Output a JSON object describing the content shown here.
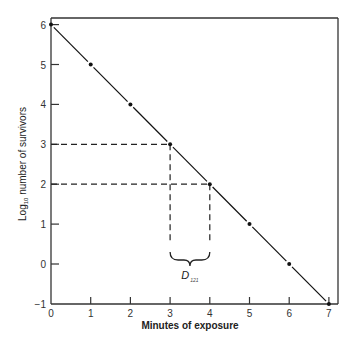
{
  "chart_data": {
    "type": "line",
    "title": "",
    "xlabel": "Minutes of exposure",
    "ylabel": "Log10 number of survivors",
    "ylabel_parts": {
      "main": "Log",
      "sub": "10",
      "rest": " number of survivors"
    },
    "x": [
      0,
      1,
      2,
      3,
      4,
      5,
      6,
      7
    ],
    "series": [
      {
        "name": "Survivor curve",
        "values": [
          6,
          5,
          4,
          3,
          2,
          1,
          0,
          -1
        ]
      }
    ],
    "xlim": [
      0,
      7
    ],
    "ylim": [
      -1,
      6
    ],
    "xticks": [
      "0",
      "1",
      "2",
      "3",
      "4",
      "5",
      "6",
      "7"
    ],
    "yticks": [
      "6",
      "5",
      "4",
      "3",
      "2",
      "1",
      "0",
      "−1"
    ],
    "grid": false,
    "legend": null,
    "annotations": [
      {
        "type": "dashed-guide",
        "from": [
          0,
          3
        ],
        "to": [
          3,
          3
        ]
      },
      {
        "type": "dashed-guide",
        "from": [
          0,
          2
        ],
        "to": [
          4,
          2
        ]
      },
      {
        "type": "dashed-guide",
        "from": [
          3,
          3
        ],
        "to": [
          3,
          0.5
        ]
      },
      {
        "type": "dashed-guide",
        "from": [
          4,
          2
        ],
        "to": [
          4,
          0.5
        ]
      },
      {
        "type": "brace",
        "x_range": [
          3,
          4
        ],
        "label": "D",
        "label_sub": "121"
      }
    ],
    "color": "#111111"
  }
}
